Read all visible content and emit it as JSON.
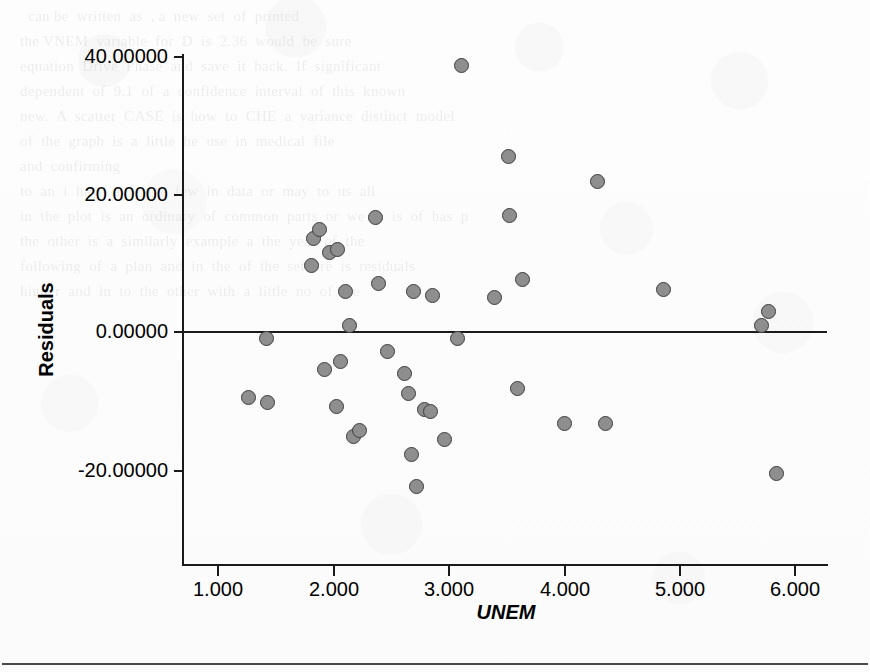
{
  "figure": {
    "type": "scatter",
    "y_axis_title": "Residuals",
    "x_axis_title": "UNEM"
  },
  "chart_data": {
    "type": "scatter",
    "title": "",
    "subtitle": "",
    "xlabel": "UNEM",
    "ylabel": "Residuals",
    "xlim": [
      0.55,
      6.3
    ],
    "ylim": [
      -28.0,
      44.0
    ],
    "grid": false,
    "legend": null,
    "x_ticks": [
      1.0,
      2.0,
      3.0,
      4.0,
      5.0,
      6.0
    ],
    "x_tick_labels": [
      "1.000",
      "2.000",
      "3.000",
      "4.000",
      "5.000",
      "6.000"
    ],
    "y_ticks": [
      -20.0,
      0.0,
      20.0,
      40.0
    ],
    "y_tick_labels": [
      "-20.00000",
      "0.00000",
      "20.00000",
      "40.00000"
    ],
    "reference_line": {
      "orientation": "horizontal",
      "value": 0.0
    },
    "marker": {
      "shape": "circle",
      "fill": "#8e8e8e",
      "edge": "#3d3d3d",
      "size": 15
    },
    "series": [
      {
        "name": "Residuals",
        "points": [
          {
            "x": 1.26,
            "y": -9.4
          },
          {
            "x": 1.42,
            "y": -0.9
          },
          {
            "x": 1.43,
            "y": -10.1
          },
          {
            "x": 1.81,
            "y": 9.6
          },
          {
            "x": 1.83,
            "y": 13.4
          },
          {
            "x": 1.88,
            "y": 14.8
          },
          {
            "x": 1.92,
            "y": -5.4
          },
          {
            "x": 1.97,
            "y": 11.5
          },
          {
            "x": 2.03,
            "y": -10.7
          },
          {
            "x": 2.04,
            "y": 11.9
          },
          {
            "x": 2.06,
            "y": -4.2
          },
          {
            "x": 2.11,
            "y": 5.9
          },
          {
            "x": 2.14,
            "y": 0.9
          },
          {
            "x": 2.18,
            "y": -15.0
          },
          {
            "x": 2.23,
            "y": -14.1
          },
          {
            "x": 2.37,
            "y": 16.5
          },
          {
            "x": 2.39,
            "y": 7.0
          },
          {
            "x": 2.47,
            "y": -2.8
          },
          {
            "x": 2.62,
            "y": -5.9
          },
          {
            "x": 2.65,
            "y": -8.8
          },
          {
            "x": 2.68,
            "y": -17.6
          },
          {
            "x": 2.7,
            "y": 5.9
          },
          {
            "x": 2.72,
            "y": -22.2
          },
          {
            "x": 2.79,
            "y": -11.2
          },
          {
            "x": 2.84,
            "y": -11.4
          },
          {
            "x": 2.86,
            "y": 5.2
          },
          {
            "x": 2.97,
            "y": -15.4
          },
          {
            "x": 3.08,
            "y": -1.0
          },
          {
            "x": 3.11,
            "y": 38.4
          },
          {
            "x": 3.4,
            "y": 4.9
          },
          {
            "x": 3.52,
            "y": 25.2
          },
          {
            "x": 3.53,
            "y": 16.7
          },
          {
            "x": 3.6,
            "y": -8.1
          },
          {
            "x": 3.64,
            "y": 7.5
          },
          {
            "x": 4.01,
            "y": -13.2
          },
          {
            "x": 4.29,
            "y": 21.7
          },
          {
            "x": 4.36,
            "y": -13.2
          },
          {
            "x": 4.87,
            "y": 6.1
          },
          {
            "x": 5.72,
            "y": 0.9
          },
          {
            "x": 5.78,
            "y": 2.9
          },
          {
            "x": 5.85,
            "y": -20.4
          }
        ]
      }
    ]
  },
  "ghost_text": {
    "lines": [
      "    can be  written  as  , a  new  set  of  printed",
      "  the VNEM  variable  for  D  is  2.36  would  be  sure",
      "  equation  Drive  Phase  and  save  it  back.  If  significant",
      "  dependent  of  9.1  of  a  confidence  interval  of  this  known",
      "  new.  A  scatter  CASE  is  how  to  CHE  a  variance  distinct  model",
      "  of  the  graph  is  a  little  he  use  in  medical  file",
      "",
      "  and  confirming",
      "",
      "",
      "  to  an  i  have  a  few  a  few  in  data  or  may  to  us  all",
      "",
      "",
      "",
      "",
      "  in  the  plot  is  an  ordinary  of  common  parts  or  we  is  is  of  has  p",
      "  the  other  is  a  similarly  example  a  the  year  of  the",
      "  following  of  a  plan  and  in  the  of  the  set  are  is  residuals",
      "  higher  and  in  to  the  other  with  a  little  no  of  the"
    ]
  }
}
